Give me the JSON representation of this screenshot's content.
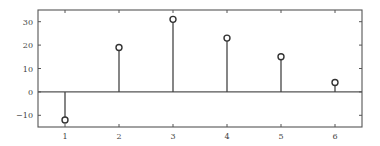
{
  "chart_data": {
    "type": "stem",
    "title": "",
    "xlabel": "",
    "ylabel": "",
    "x": [
      1,
      2,
      3,
      4,
      5,
      6
    ],
    "values": [
      -12,
      19,
      31,
      23,
      15,
      4
    ],
    "xlim": [
      0.5,
      6.5
    ],
    "ylim": [
      -15,
      35
    ],
    "xticks": [
      1,
      2,
      3,
      4,
      5,
      6
    ],
    "xtick_labels": [
      "1",
      "2",
      "3",
      "4",
      "5",
      "6"
    ],
    "yticks": [
      -10,
      0,
      10,
      20,
      30
    ],
    "ytick_labels": [
      "−10",
      "0",
      "10",
      "20",
      "30"
    ],
    "baseline": 0,
    "grid": false,
    "legend": null,
    "marker": "open-circle",
    "colors": {
      "axes": "#555555",
      "stem": "#444444",
      "marker_edge": "#333333",
      "marker_face": "#ffffff",
      "baseline": "#555555",
      "tick_label": "#444444"
    }
  },
  "layout": {
    "plot_box": {
      "left": 38,
      "top": 10,
      "right": 362,
      "bottom": 127
    }
  }
}
